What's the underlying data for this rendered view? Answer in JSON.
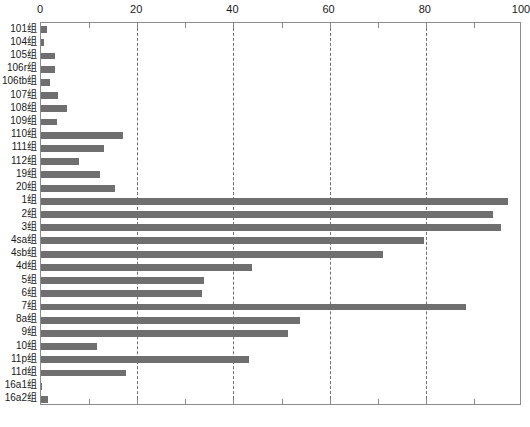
{
  "chart_data": {
    "type": "bar",
    "orientation": "horizontal",
    "title": "",
    "xlabel": "",
    "ylabel": "",
    "xlim": [
      0,
      100
    ],
    "ylim": null,
    "grid": true,
    "grid_axis": "x",
    "legend": null,
    "bar_color": "#6f6f6f",
    "axis_color": "#8c8c8c",
    "xticks": [
      0,
      20,
      40,
      60,
      80,
      100
    ],
    "xtick_labels": [
      "0",
      "20",
      "40",
      "60",
      "80",
      "100"
    ],
    "xminor_ticks": [
      10,
      30,
      50,
      70,
      90
    ],
    "categories": [
      "101组",
      "104组",
      "105组",
      "106r组",
      "106tb组",
      "107组",
      "108组",
      "109组",
      "110组",
      "111组",
      "112组",
      "19组",
      "20组",
      "1组",
      "2组",
      "3组",
      "4sa组",
      "4sb组",
      "4d组",
      "5组",
      "6组",
      "7组",
      "8a组",
      "9组",
      "10组",
      "11p组",
      "11d组",
      "16a1组",
      "16a2组"
    ],
    "values": [
      1.3,
      0.6,
      3.0,
      3.0,
      1.9,
      3.6,
      5.4,
      3.3,
      17.0,
      13.2,
      7.8,
      12.3,
      15.4,
      97.0,
      94.0,
      95.6,
      79.6,
      71.1,
      43.9,
      33.9,
      33.5,
      88.4,
      53.8,
      51.3,
      11.6,
      43.2,
      17.7,
      0.2,
      1.4
    ]
  }
}
